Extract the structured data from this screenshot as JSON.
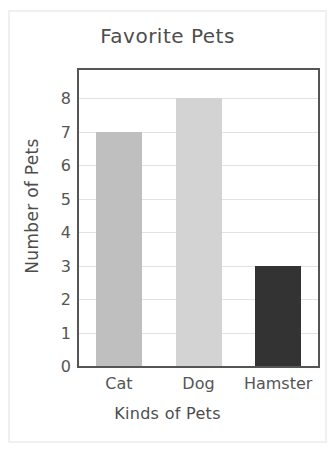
{
  "chart_data": {
    "type": "bar",
    "title": "Favorite Pets",
    "xlabel": "Kinds of Pets",
    "ylabel": "Number of Pets",
    "categories": [
      "Cat",
      "Dog",
      "Hamster"
    ],
    "values": [
      7,
      8,
      3
    ],
    "bar_colors": [
      "#bfbfbf",
      "#d3d3d3",
      "#333333"
    ],
    "ylim": [
      0,
      8.85
    ],
    "yticks": [
      0,
      1,
      2,
      3,
      4,
      5,
      6,
      7,
      8
    ],
    "ytick_labels": [
      "0",
      "1",
      "2",
      "3",
      "4",
      "5",
      "6",
      "7",
      "8"
    ],
    "grid": true,
    "grid_axis": "y",
    "legend": false,
    "legend_position": "none",
    "axis_color": "#555555",
    "grid_color": "#e2e2e2",
    "text_color": "#4d4d4d",
    "background": "#ffffff"
  }
}
